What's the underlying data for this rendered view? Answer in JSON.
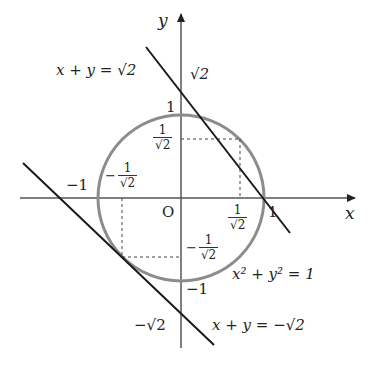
{
  "figure": {
    "type": "coordinate diagram",
    "colors": {
      "axis": "#555555",
      "circle": "#8c8c8c",
      "tangent_line": "#1a1a1a",
      "dashed_guide": "#444444",
      "text": "#222222"
    }
  },
  "axes": {
    "x_label": "x",
    "y_label": "y",
    "origin_label": "O"
  },
  "curves": {
    "circle": {
      "equation_label": "x² + y² = 1",
      "center": [
        0,
        0
      ],
      "radius": 1
    },
    "upper_line": {
      "equation_label": "x + y = √2",
      "y_intercept_label": "√2"
    },
    "lower_line": {
      "equation_label": "x + y = −√2",
      "y_intercept_label": "−√2"
    }
  },
  "tick_labels": {
    "x_pos_one": "1",
    "x_neg_one": "−1",
    "y_pos_one": "1",
    "y_neg_one": "−1",
    "x_pos_frac": {
      "sign": "",
      "num": "1",
      "den": "√2"
    },
    "y_pos_frac": {
      "sign": "",
      "num": "1",
      "den": "√2"
    },
    "x_neg_frac": {
      "sign": "−",
      "num": "1",
      "den": "√2"
    },
    "y_neg_frac": {
      "sign": "−",
      "num": "1",
      "den": "√2"
    }
  },
  "tangent_points": [
    {
      "label": "(1/√2, 1/√2)"
    },
    {
      "label": "(−1/√2, −1/√2)"
    }
  ]
}
